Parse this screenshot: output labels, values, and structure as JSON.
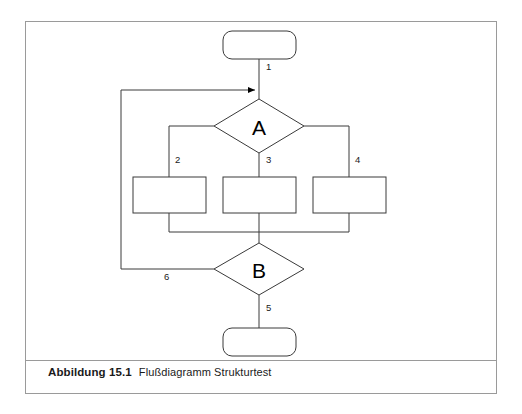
{
  "figure": {
    "caption_label": "Abbildung 15.1",
    "caption_text": "Flußdiagramm Strukturtest"
  },
  "diagram": {
    "nodes": {
      "start": {
        "shape": "rounded-rect",
        "label": ""
      },
      "decision_a": {
        "shape": "diamond",
        "label": "A"
      },
      "process_left": {
        "shape": "rect",
        "label": ""
      },
      "process_middle": {
        "shape": "rect",
        "label": ""
      },
      "process_right": {
        "shape": "rect",
        "label": ""
      },
      "decision_b": {
        "shape": "diamond",
        "label": "B"
      },
      "end": {
        "shape": "rounded-rect",
        "label": ""
      }
    },
    "edges": [
      {
        "id": "e1",
        "label": "1",
        "from": "start",
        "to": "decision_a"
      },
      {
        "id": "e2",
        "label": "2",
        "from": "decision_a",
        "to": "process_left"
      },
      {
        "id": "e3",
        "label": "3",
        "from": "decision_a",
        "to": "process_middle"
      },
      {
        "id": "e4",
        "label": "4",
        "from": "decision_a",
        "to": "process_right"
      },
      {
        "id": "e5",
        "label": "5",
        "from": "decision_b",
        "to": "end"
      },
      {
        "id": "e6",
        "label": "6",
        "from": "decision_b",
        "to": "decision_a"
      }
    ]
  },
  "colors": {
    "stroke": "#3a3a3a",
    "frame": "#9a9a9a",
    "text": "#1a1a1a",
    "background": "#ffffff"
  }
}
